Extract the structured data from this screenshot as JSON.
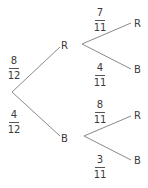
{
  "diagram": {
    "type": "probability-tree",
    "colors": {
      "line": "#8a8a8a",
      "text": "#3a3a3a"
    },
    "first_stage": {
      "branches": [
        {
          "outcome": "R",
          "probability": {
            "numerator": "8",
            "denominator": "12"
          }
        },
        {
          "outcome": "B",
          "probability": {
            "numerator": "4",
            "denominator": "12"
          }
        }
      ]
    },
    "second_stage": {
      "after_R": {
        "branches": [
          {
            "outcome": "R",
            "probability": {
              "numerator": "7",
              "denominator": "11"
            }
          },
          {
            "outcome": "B",
            "probability": {
              "numerator": "4",
              "denominator": "11"
            }
          }
        ]
      },
      "after_B": {
        "branches": [
          {
            "outcome": "R",
            "probability": {
              "numerator": "8",
              "denominator": "11"
            }
          },
          {
            "outcome": "B",
            "probability": {
              "numerator": "3",
              "denominator": "11"
            }
          }
        ]
      }
    }
  }
}
